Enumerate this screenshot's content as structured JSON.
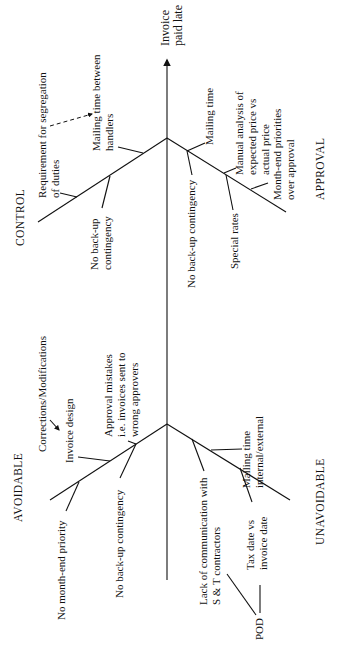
{
  "diagram": {
    "type": "fishbone",
    "orientation": "rotated-90-ccw",
    "effect": {
      "lines": [
        "Invoice",
        "paid late"
      ]
    },
    "categories": {
      "control": "CONTROL",
      "approval": "APPROVAL",
      "avoidable": "AVOIDABLE",
      "unavoidable": "UNAVOIDABLE"
    },
    "causes": {
      "control": [
        {
          "id": "segregation",
          "lines": [
            "Requirement for segregation",
            "of duties"
          ]
        },
        {
          "id": "mailing_between",
          "lines": [
            "Mailing time between",
            "handlers"
          ]
        },
        {
          "id": "no_backup",
          "lines": [
            "No back-up",
            "contingency"
          ]
        }
      ],
      "approval": [
        {
          "id": "mailing_time",
          "lines": [
            "Mailing time"
          ]
        },
        {
          "id": "no_backup",
          "lines": [
            "No back-up contingency"
          ]
        },
        {
          "id": "manual_analysis",
          "lines": [
            "Manual analysis of",
            "expected price vs",
            "actual price"
          ]
        },
        {
          "id": "special_rates",
          "lines": [
            "Special rates"
          ]
        },
        {
          "id": "month_end",
          "lines": [
            "Month-end priorities",
            "over approval"
          ]
        }
      ],
      "avoidable": [
        {
          "id": "corrections",
          "lines": [
            "Corrections/Modifications"
          ]
        },
        {
          "id": "invoice_design",
          "lines": [
            "Invoice design"
          ]
        },
        {
          "id": "approval_mistakes",
          "lines": [
            "Approval mistakes",
            "i.e. invoices sent to",
            "wrong approvers"
          ]
        },
        {
          "id": "no_backup",
          "lines": [
            "No back-up contingency"
          ]
        },
        {
          "id": "no_month_end",
          "lines": [
            "No month-end priority"
          ]
        }
      ],
      "unavoidable": [
        {
          "id": "lack_comm",
          "lines": [
            "Lack of communication with",
            "S & T contractors"
          ]
        },
        {
          "id": "mailing_internal",
          "lines": [
            "Mailing time",
            "internal/external"
          ]
        },
        {
          "id": "tax_date",
          "lines": [
            "Tax date vs",
            "invoice date"
          ]
        },
        {
          "id": "pod",
          "lines": [
            "POD"
          ]
        }
      ]
    },
    "colors": {
      "ink": "#111111",
      "background": "#ffffff"
    }
  }
}
